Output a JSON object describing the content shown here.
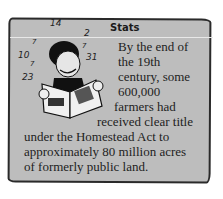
{
  "sidebar_box": {
    "title": "Stats",
    "lines": [
      "By the end of",
      "the 19th",
      "century, some",
      "600,000",
      "farmers had",
      "received clear title",
      "under the Homestead Act to",
      "approximately 80 million acres",
      "of formerly public land."
    ],
    "illustration": {
      "description": "cartoon boy reading a magazine",
      "numbers": [
        "14",
        "7",
        "10",
        "7",
        "23",
        "2",
        "7",
        "31"
      ]
    },
    "colors": {
      "background": "#bdbdbd",
      "border": "#2a2a2a",
      "text": "#1e1e1e"
    }
  }
}
